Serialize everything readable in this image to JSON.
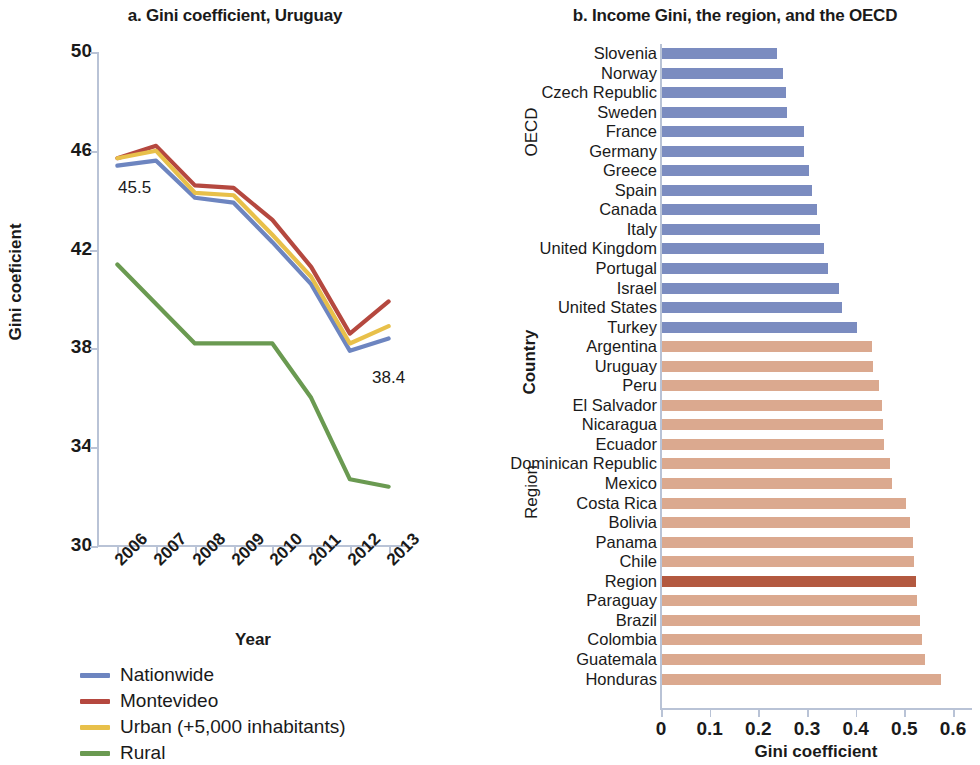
{
  "chart_data": [
    {
      "panel": "a",
      "type": "line",
      "title": "a. Gini coefficient, Uruguay",
      "xlabel": "Year",
      "ylabel": "Gini coeficient",
      "categories": [
        "2006",
        "2007",
        "2008",
        "2009",
        "2010",
        "2011",
        "2012",
        "2013"
      ],
      "ylim": [
        30,
        50
      ],
      "yticks": [
        30,
        34,
        38,
        42,
        46,
        50
      ],
      "grid": false,
      "legend_position": "bottom-left",
      "annotations": [
        {
          "text": "45.5",
          "series": "Nationwide",
          "x": "2006"
        },
        {
          "text": "38.4",
          "series": "Nationwide",
          "x": "2013"
        }
      ],
      "series": [
        {
          "name": "Nationwide",
          "color": "#6d85c0",
          "values": [
            45.4,
            45.6,
            44.1,
            43.9,
            42.3,
            40.6,
            37.9,
            38.4
          ]
        },
        {
          "name": "Montevideo",
          "color": "#b5483f",
          "values": [
            45.7,
            46.2,
            44.6,
            44.5,
            43.2,
            41.3,
            38.6,
            39.9
          ]
        },
        {
          "name": "Urban (+5,000 inhabitants)",
          "color": "#e8c04a",
          "values": [
            45.7,
            46.0,
            44.3,
            44.2,
            42.6,
            40.9,
            38.2,
            38.9
          ]
        },
        {
          "name": "Rural",
          "color": "#6a9a51",
          "values": [
            41.4,
            39.8,
            38.2,
            38.2,
            38.2,
            36.0,
            32.7,
            32.4
          ]
        }
      ]
    },
    {
      "panel": "b",
      "type": "bar",
      "orientation": "horizontal",
      "title": "b. Income Gini, the region, and the OECD",
      "xlabel": "Gini coefficient",
      "ylabel": "Country",
      "xlim": [
        0,
        0.6
      ],
      "xticks": [
        "0",
        "0.1",
        "0.2",
        "0.3",
        "0.4",
        "0.5",
        "0.6"
      ],
      "xtick_values": [
        0,
        0.1,
        0.2,
        0.3,
        0.4,
        0.5,
        0.6
      ],
      "group_labels": [
        "OECD",
        "Region"
      ],
      "colors": {
        "oecd": "#7b8cc0",
        "region": "#dba98f",
        "highlight": "#b35940"
      },
      "bars": [
        {
          "label": "Slovenia",
          "value": 0.238,
          "group": "OECD",
          "highlight": false
        },
        {
          "label": "Norway",
          "value": 0.25,
          "group": "OECD",
          "highlight": false
        },
        {
          "label": "Czech Republic",
          "value": 0.256,
          "group": "OECD",
          "highlight": false
        },
        {
          "label": "Sweden",
          "value": 0.259,
          "group": "OECD",
          "highlight": false
        },
        {
          "label": "France",
          "value": 0.294,
          "group": "OECD",
          "highlight": false
        },
        {
          "label": "Germany",
          "value": 0.294,
          "group": "OECD",
          "highlight": false
        },
        {
          "label": "Greece",
          "value": 0.303,
          "group": "OECD",
          "highlight": false
        },
        {
          "label": "Spain",
          "value": 0.31,
          "group": "OECD",
          "highlight": false
        },
        {
          "label": "Canada",
          "value": 0.32,
          "group": "OECD",
          "highlight": false
        },
        {
          "label": "Italy",
          "value": 0.327,
          "group": "OECD",
          "highlight": false
        },
        {
          "label": "United Kingdom",
          "value": 0.335,
          "group": "OECD",
          "highlight": false
        },
        {
          "label": "Portugal",
          "value": 0.344,
          "group": "OECD",
          "highlight": false
        },
        {
          "label": "Israel",
          "value": 0.365,
          "group": "OECD",
          "highlight": false
        },
        {
          "label": "United States",
          "value": 0.372,
          "group": "OECD",
          "highlight": false
        },
        {
          "label": "Turkey",
          "value": 0.402,
          "group": "OECD",
          "highlight": false
        },
        {
          "label": "Argentina",
          "value": 0.434,
          "group": "Region",
          "highlight": false
        },
        {
          "label": "Uruguay",
          "value": 0.436,
          "group": "Region",
          "highlight": false
        },
        {
          "label": "Peru",
          "value": 0.448,
          "group": "Region",
          "highlight": false
        },
        {
          "label": "El Salvador",
          "value": 0.453,
          "group": "Region",
          "highlight": false
        },
        {
          "label": "Nicaragua",
          "value": 0.456,
          "group": "Region",
          "highlight": false
        },
        {
          "label": "Ecuador",
          "value": 0.459,
          "group": "Region",
          "highlight": false
        },
        {
          "label": "Dominican Republic",
          "value": 0.471,
          "group": "Region",
          "highlight": false
        },
        {
          "label": "Mexico",
          "value": 0.475,
          "group": "Region",
          "highlight": false
        },
        {
          "label": "Costa Rica",
          "value": 0.504,
          "group": "Region",
          "highlight": false
        },
        {
          "label": "Bolivia",
          "value": 0.512,
          "group": "Region",
          "highlight": false
        },
        {
          "label": "Panama",
          "value": 0.517,
          "group": "Region",
          "highlight": false
        },
        {
          "label": "Chile",
          "value": 0.52,
          "group": "Region",
          "highlight": false
        },
        {
          "label": "Region",
          "value": 0.523,
          "group": "Region",
          "highlight": true
        },
        {
          "label": "Paraguay",
          "value": 0.526,
          "group": "Region",
          "highlight": false
        },
        {
          "label": "Brazil",
          "value": 0.533,
          "group": "Region",
          "highlight": false
        },
        {
          "label": "Colombia",
          "value": 0.536,
          "group": "Region",
          "highlight": false
        },
        {
          "label": "Guatemala",
          "value": 0.543,
          "group": "Region",
          "highlight": false
        },
        {
          "label": "Honduras",
          "value": 0.575,
          "group": "Region",
          "highlight": false
        }
      ]
    }
  ],
  "panel_a": {
    "title": "a. Gini coefficient, Uruguay",
    "ylabel": "Gini coeficient",
    "xlabel": "Year",
    "annotation_start": "45.5",
    "annotation_end": "38.4",
    "legend": [
      {
        "label": "Nationwide",
        "color": "#6d85c0"
      },
      {
        "label": "Montevideo",
        "color": "#b5483f"
      },
      {
        "label": "Urban (+5,000 inhabitants)",
        "color": "#e8c04a"
      },
      {
        "label": "Rural",
        "color": "#6a9a51"
      }
    ]
  },
  "panel_b": {
    "title": "b. Income Gini, the region, and the OECD",
    "ylabel": "Country",
    "xlabel": "Gini coefficient",
    "group_oecd": "OECD",
    "group_region": "Region"
  }
}
